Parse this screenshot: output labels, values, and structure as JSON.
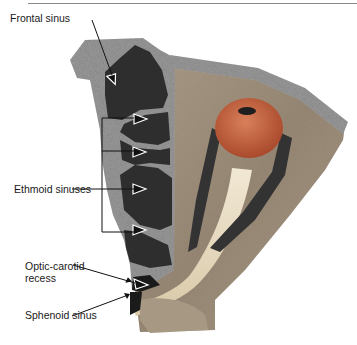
{
  "figure": {
    "type": "anatomical-diagram",
    "labels": {
      "frontal_sinus": "Frontal sinus",
      "ethmoid_sinuses": "Ethmoid sinuses",
      "optic_carotid_recess_line1": "Optic-carotid",
      "optic_carotid_recess_line2": "recess",
      "sphenoid_sinus": "Sphenoid sinus"
    },
    "colors": {
      "bone_speckle": "#9a9a9a",
      "sinus_dark": "#2e2e2e",
      "globe": "#c8623e",
      "optic_nerve": "#e8dcc2",
      "muscle_band": "#3a3a3a",
      "orbit_tissue": "#a89a88",
      "rule": "#8a8a8a"
    }
  }
}
